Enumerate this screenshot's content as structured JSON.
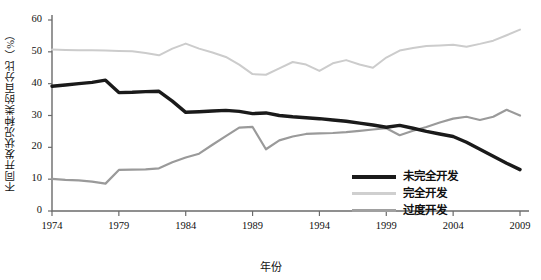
{
  "chart_data": {
    "type": "line",
    "title": "",
    "xlabel": "年份",
    "ylabel": "不同开发状况种类的百分比（%）",
    "xlim": [
      1974,
      2009
    ],
    "ylim": [
      0,
      60
    ],
    "ytick_values": [
      0,
      10,
      20,
      30,
      40,
      50,
      60
    ],
    "ytick_labels": [
      "0",
      "10",
      "20",
      "30",
      "40",
      "50",
      "60"
    ],
    "xtick_values": [
      1974,
      1979,
      1984,
      1989,
      1994,
      1999,
      2004,
      2009
    ],
    "xtick_labels": [
      "1974",
      "1979",
      "1984",
      "1989",
      "1994",
      "1999",
      "2004",
      "2009"
    ],
    "grid": false,
    "legend_position": "bottom-right",
    "x": [
      1974,
      1975,
      1976,
      1977,
      1978,
      1979,
      1980,
      1981,
      1982,
      1983,
      1984,
      1985,
      1986,
      1987,
      1988,
      1989,
      1990,
      1991,
      1992,
      1993,
      1994,
      1995,
      1996,
      1997,
      1998,
      1999,
      2000,
      2001,
      2002,
      2003,
      2004,
      2005,
      2006,
      2007,
      2008,
      2009
    ],
    "series": [
      {
        "name": "未完全开发",
        "color": "#1a1a1a",
        "width": 3.4,
        "values": [
          39.2,
          39.6,
          40.0,
          40.4,
          41.1,
          37.2,
          37.3,
          37.5,
          37.6,
          34.5,
          31.0,
          31.2,
          31.4,
          31.6,
          31.3,
          30.6,
          30.8,
          30.0,
          29.6,
          29.3,
          29.0,
          28.6,
          28.2,
          27.6,
          27.0,
          26.3,
          26.9,
          26.0,
          25.0,
          24.2,
          23.4,
          21.6,
          19.4,
          17.2,
          15.0,
          13.0
        ]
      },
      {
        "name": "完全开发",
        "color": "#cccccc",
        "width": 2.0,
        "values": [
          50.7,
          50.6,
          50.5,
          50.5,
          50.4,
          50.3,
          50.2,
          49.6,
          48.9,
          51.0,
          52.6,
          51.0,
          49.8,
          48.4,
          46.0,
          43.0,
          42.8,
          44.8,
          46.8,
          46.0,
          44.0,
          46.4,
          47.4,
          46.0,
          45.0,
          48.2,
          50.4,
          51.2,
          51.8,
          52.0,
          52.2,
          51.6,
          52.5,
          53.5,
          55.2,
          57.0
        ]
      },
      {
        "name": "过度开发",
        "color": "#9a9a9a",
        "width": 2.2,
        "values": [
          10.1,
          9.8,
          9.6,
          9.2,
          8.6,
          12.9,
          13.0,
          13.1,
          13.4,
          15.3,
          16.8,
          18.0,
          20.8,
          23.5,
          26.2,
          26.4,
          19.4,
          22.2,
          23.4,
          24.2,
          24.4,
          24.5,
          24.8,
          25.2,
          25.6,
          26.0,
          23.8,
          25.2,
          26.4,
          27.8,
          29.0,
          29.6,
          28.6,
          29.6,
          31.8,
          30.0
        ]
      }
    ]
  },
  "legend": {
    "items": [
      {
        "label": "未完全开发",
        "color": "#1a1a1a",
        "width": 4.5
      },
      {
        "label": "完全开发",
        "color": "#cfcfcf",
        "width": 3.2
      },
      {
        "label": "过度开发",
        "color": "#a0a0a0",
        "width": 3.4
      }
    ]
  }
}
